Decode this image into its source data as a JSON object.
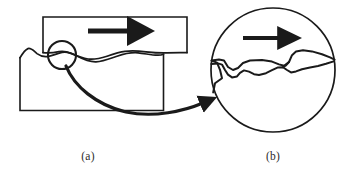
{
  "figure": {
    "kind": "technical-line-diagram",
    "background_color": "#ffffff",
    "line_color": "#1a1a1a",
    "panels": [
      {
        "id": "a",
        "caption": "(a)",
        "caption_x": 88,
        "caption_y": 158,
        "elements": {
          "upper_body_label": "upper block",
          "lower_body_label": "lower block",
          "interface_label": "rough contact interface",
          "highlight_circle_label": "magnified region marker",
          "sliding_arrow_label": "sliding direction arrow",
          "callout_arrow_label": "magnification callout arrow"
        }
      },
      {
        "id": "b",
        "caption": "(b)",
        "caption_x": 268,
        "caption_y": 158,
        "elements": {
          "magnifier_label": "magnified view circle",
          "asperity_label": "interlocking asperities",
          "sliding_arrow_label": "sliding direction arrow"
        }
      }
    ]
  },
  "geometry": {
    "upper_block": {
      "left": 42.5,
      "top": 16.5,
      "right": 187.5,
      "bottom_flat_y": 52.5,
      "note": "open-bottom rectangle; bottom boundary is the rough interface curve"
    },
    "lower_block": {
      "left": 19.5,
      "right": 163.5,
      "bottom": 110.5,
      "top_note": "top boundary is the rough interface curve"
    },
    "marker_circle": {
      "cx": 62,
      "cy": 55,
      "r": 14
    },
    "magnifier_circle": {
      "cx": 273,
      "cy": 70,
      "r": 62
    },
    "arrow_a": {
      "x1": 88,
      "y1": 31,
      "x2": 140,
      "y2": 31,
      "stroke_width": 5
    },
    "arrow_b": {
      "x1": 243,
      "y1": 38,
      "x2": 288,
      "y2": 38,
      "stroke_width": 4
    },
    "callout_arrow": {
      "start_x": 67,
      "start_y": 66,
      "end_x": 212,
      "end_y": 101,
      "stroke_width": 3.2
    }
  },
  "captions": {
    "panel_a": "(a)",
    "panel_b": "(b)"
  },
  "colors": {
    "ink": "#1a1a1a",
    "caption_ink": "#2b2b2b",
    "paper": "#ffffff"
  }
}
